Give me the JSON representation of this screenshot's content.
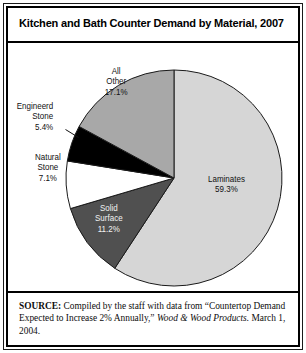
{
  "figure": {
    "title": "Kitchen and Bath Counter Demand by Material, 2007",
    "source": {
      "lead": "SOURCE:",
      "body_1": " Compiled by the staff with data from “Countertop Demand Expected to Increase 2% Annually,” ",
      "publication": "Wood & Wood Products.",
      "body_2": " March 1, 2004."
    }
  },
  "chart_data": {
    "type": "pie",
    "title": "Kitchen and Bath Counter Demand by Material, 2007",
    "unit": "percent",
    "start_angle_deg": 0,
    "direction": "clockwise",
    "legend": "none (labels on slices)",
    "categories": [
      "Laminates",
      "Solid Surface",
      "Natural Stone",
      "Engineerd Stone",
      "All Other"
    ],
    "values": [
      59.3,
      11.2,
      7.1,
      5.4,
      17.1
    ],
    "slices": [
      {
        "name": "Laminates",
        "label_line1": "Laminates",
        "label_line2": "59.3%",
        "value": 59.3,
        "color": "#d6d6d6",
        "label_color": "#111111"
      },
      {
        "name": "Solid Surface",
        "label_line1": "Solid",
        "label_line2": "Surface",
        "label_line3": "11.2%",
        "value": 11.2,
        "color": "#505050",
        "label_color": "#f2f2f2"
      },
      {
        "name": "Natural Stone",
        "label_line1": "Natural",
        "label_line2": "Stone",
        "label_line3": "7.1%",
        "value": 7.1,
        "color": "#ffffff",
        "label_color": "#111111"
      },
      {
        "name": "Engineerd Stone",
        "label_line1": "Engineerd",
        "label_line2": "Stone",
        "label_line3": "5.4%",
        "value": 5.4,
        "color": "#000000",
        "label_color": "#111111"
      },
      {
        "name": "All Other",
        "label_line1": "All",
        "label_line2": "Other",
        "label_line3": "17.1%",
        "value": 17.1,
        "color": "#a8a8a8",
        "label_color": "#131313"
      }
    ]
  },
  "geometry": {
    "center_x": 166,
    "center_y": 137,
    "radius": 108,
    "outline_color": "#1a1a1a"
  }
}
